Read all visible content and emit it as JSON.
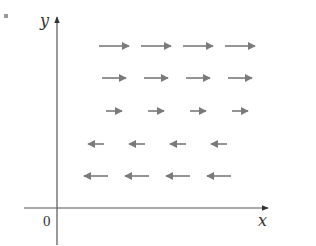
{
  "figure": {
    "type": "vector_field",
    "axes": {
      "x_label": "x",
      "y_label": "y",
      "origin_label": "0"
    },
    "colors": {
      "axis": "#555555",
      "arrow": "#7a7a7a"
    },
    "rows": [
      {
        "direction": "right",
        "length": 30,
        "count": 4
      },
      {
        "direction": "right",
        "length": 24,
        "count": 4
      },
      {
        "direction": "right",
        "length": 16,
        "count": 4
      },
      {
        "direction": "left",
        "length": 16,
        "count": 4
      },
      {
        "direction": "left",
        "length": 24,
        "count": 4
      }
    ]
  }
}
